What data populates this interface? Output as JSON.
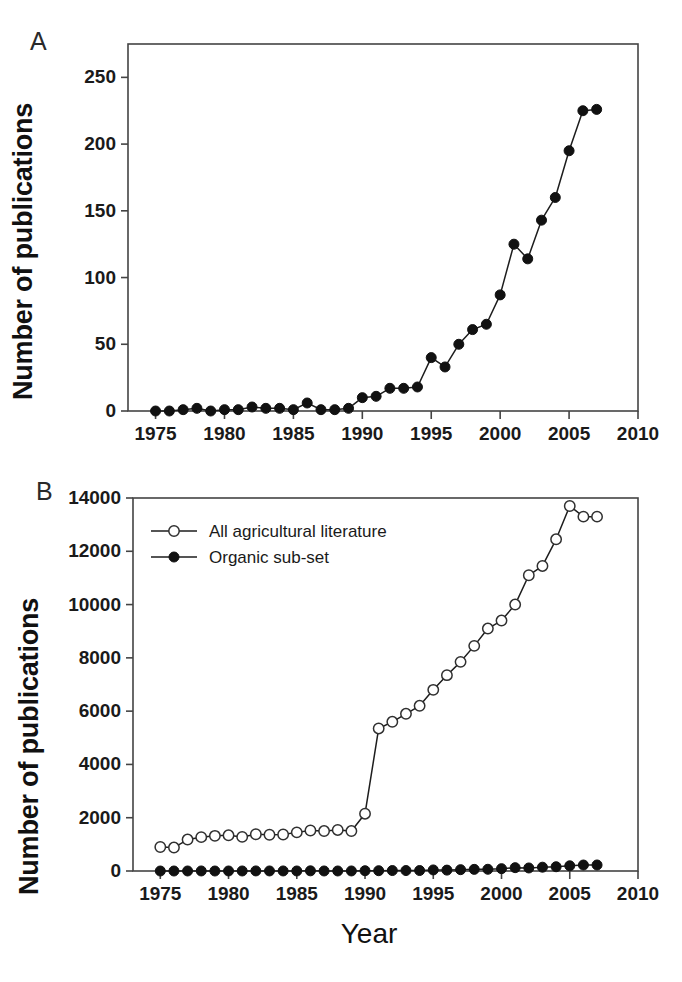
{
  "figure": {
    "panels": [
      {
        "letter": "A",
        "ylabel": "Number of publications",
        "xlabel": ""
      },
      {
        "letter": "B",
        "ylabel": "Number of publications",
        "xlabel": "Year"
      }
    ]
  },
  "chart_data": [
    {
      "type": "line",
      "panel": "A",
      "title": "",
      "xlabel": "",
      "ylabel": "Number of publications",
      "xlim": [
        1973,
        2010
      ],
      "ylim": [
        0,
        275
      ],
      "xticks": [
        1975,
        1980,
        1985,
        1990,
        1995,
        2000,
        2005,
        2010
      ],
      "xticklabels": [
        "1975",
        "1980",
        "1985",
        "1990",
        "1995",
        "2000",
        "2005",
        "2010"
      ],
      "yticks": [
        0,
        50,
        100,
        150,
        200,
        250
      ],
      "yticklabels": [
        "0",
        "50",
        "100",
        "150",
        "200",
        "250"
      ],
      "grid": false,
      "legend": null,
      "series": [
        {
          "name": "Organic sub-set",
          "marker": "filled-circle",
          "x": [
            1975,
            1976,
            1977,
            1978,
            1979,
            1980,
            1981,
            1982,
            1983,
            1984,
            1985,
            1986,
            1987,
            1988,
            1989,
            1990,
            1991,
            1992,
            1993,
            1994,
            1995,
            1996,
            1997,
            1998,
            1999,
            2000,
            2001,
            2002,
            2003,
            2004,
            2005,
            2006,
            2007
          ],
          "values": [
            0,
            0,
            1,
            2,
            0,
            1,
            1,
            3,
            2,
            2,
            1,
            6,
            1,
            1,
            2,
            10,
            11,
            17,
            17,
            18,
            40,
            33,
            50,
            61,
            65,
            87,
            125,
            114,
            143,
            160,
            195,
            225,
            226
          ]
        }
      ]
    },
    {
      "type": "line",
      "panel": "B",
      "title": "",
      "xlabel": "Year",
      "ylabel": "Number of publications",
      "xlim": [
        1973,
        2010
      ],
      "ylim": [
        0,
        14000
      ],
      "xticks": [
        1975,
        1980,
        1985,
        1990,
        1995,
        2000,
        2005,
        2010
      ],
      "xticklabels": [
        "1975",
        "1980",
        "1985",
        "1990",
        "1995",
        "2000",
        "2005",
        "2010"
      ],
      "yticks": [
        0,
        2000,
        4000,
        6000,
        8000,
        10000,
        12000,
        14000
      ],
      "yticklabels": [
        "0",
        "2000",
        "4000",
        "6000",
        "8000",
        "10000",
        "12000",
        "14000"
      ],
      "grid": false,
      "legend": {
        "position": "top-left",
        "entries": [
          {
            "label": "All agricultural literature",
            "marker": "open-circle"
          },
          {
            "label": "Organic sub-set",
            "marker": "filled-circle"
          }
        ]
      },
      "series": [
        {
          "name": "All agricultural literature",
          "marker": "open-circle",
          "x": [
            1975,
            1976,
            1977,
            1978,
            1979,
            1980,
            1981,
            1982,
            1983,
            1984,
            1985,
            1986,
            1987,
            1988,
            1989,
            1990,
            1991,
            1992,
            1993,
            1994,
            1995,
            1996,
            1997,
            1998,
            1999,
            2000,
            2001,
            2002,
            2003,
            2004,
            2005,
            2006,
            2007
          ],
          "values": [
            900,
            880,
            1180,
            1270,
            1320,
            1340,
            1280,
            1380,
            1360,
            1370,
            1450,
            1520,
            1500,
            1540,
            1500,
            2150,
            5350,
            5600,
            5900,
            6200,
            6800,
            7350,
            7850,
            8450,
            9100,
            9400,
            10000,
            11100,
            11450,
            12450,
            13700,
            13300,
            13300
          ]
        },
        {
          "name": "Organic sub-set",
          "marker": "filled-circle",
          "x": [
            1975,
            1976,
            1977,
            1978,
            1979,
            1980,
            1981,
            1982,
            1983,
            1984,
            1985,
            1986,
            1987,
            1988,
            1989,
            1990,
            1991,
            1992,
            1993,
            1994,
            1995,
            1996,
            1997,
            1998,
            1999,
            2000,
            2001,
            2002,
            2003,
            2004,
            2005,
            2006,
            2007
          ],
          "values": [
            0,
            0,
            1,
            2,
            0,
            1,
            1,
            3,
            2,
            2,
            1,
            6,
            1,
            1,
            2,
            10,
            11,
            17,
            17,
            18,
            40,
            33,
            50,
            61,
            65,
            87,
            125,
            114,
            143,
            160,
            195,
            225,
            226
          ]
        }
      ]
    }
  ]
}
